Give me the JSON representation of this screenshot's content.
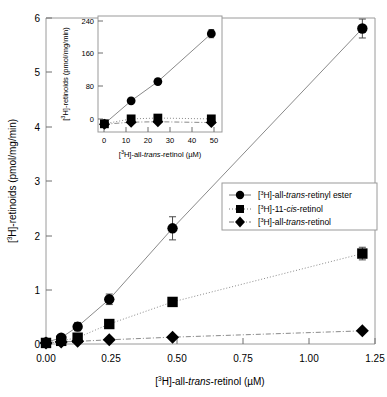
{
  "chart_data": {
    "type": "scatter",
    "title": "",
    "xlabel": "[3H]-all-trans-retinol (µM)",
    "ylabel": "[3H]-retinoids (pmol/mg/min)",
    "xlim": [
      0.0,
      1.3
    ],
    "ylim": [
      0.0,
      6.2
    ],
    "xticks": [
      "0.00",
      "0.25",
      "0.50",
      "0.75",
      "1.00",
      "1.25"
    ],
    "xtick_values": [
      0.0,
      0.25,
      0.5,
      0.75,
      1.0,
      1.25
    ],
    "yticks": [
      "0",
      "1",
      "2",
      "3",
      "4",
      "5",
      "6"
    ],
    "ytick_values": [
      0,
      1,
      2,
      3,
      4,
      5,
      6
    ],
    "grid": false,
    "legend_position": "center-right",
    "series": [
      {
        "name": "[3H]-all-trans-retinyl ester",
        "marker": "circle",
        "line": "solid",
        "x": [
          0.0,
          0.06,
          0.125,
          0.25,
          0.5,
          1.25
        ],
        "values": [
          0.03,
          0.12,
          0.33,
          0.85,
          2.2,
          6.0
        ],
        "errors": [
          0.03,
          0.05,
          0.08,
          0.1,
          0.22,
          0.18
        ]
      },
      {
        "name": "[3H]-11-cis-retinol",
        "marker": "square",
        "line": "dotted",
        "x": [
          0.0,
          0.06,
          0.125,
          0.25,
          0.5,
          1.25
        ],
        "values": [
          0.02,
          0.06,
          0.12,
          0.38,
          0.8,
          1.72
        ],
        "errors": [
          0.02,
          0.03,
          0.04,
          0.05,
          0.06,
          0.12
        ]
      },
      {
        "name": "[3H]-all-trans-retinol",
        "marker": "diamond",
        "line": "dashdot",
        "x": [
          0.0,
          0.06,
          0.125,
          0.25,
          0.5,
          1.25
        ],
        "values": [
          0.02,
          0.04,
          0.05,
          0.08,
          0.13,
          0.25
        ],
        "errors": [
          0.02,
          0.02,
          0.02,
          0.02,
          0.03,
          0.03
        ]
      }
    ]
  },
  "inset_chart_data": {
    "type": "scatter",
    "title": "",
    "xlabel": "[3H]-all-trans-retinol (µM)",
    "ylabel": "[3H]-retinoids (pmol/mg/min)",
    "xlim": [
      -3,
      55
    ],
    "ylim": [
      -18,
      265
    ],
    "xticks": [
      "0",
      "10",
      "20",
      "30",
      "40",
      "50"
    ],
    "xtick_values": [
      0,
      10,
      20,
      30,
      40,
      50
    ],
    "yticks": [
      "0",
      "80",
      "160",
      "240"
    ],
    "ytick_values": [
      0,
      80,
      160,
      240
    ],
    "grid": false,
    "series": [
      {
        "name": "[3H]-all-trans-retinyl ester",
        "marker": "circle",
        "line": "solid",
        "x": [
          0,
          12.5,
          25,
          50
        ],
        "values": [
          2,
          58,
          105,
          222
        ],
        "errors": [
          2,
          5,
          6,
          10
        ]
      },
      {
        "name": "[3H]-11-cis-retinol",
        "marker": "square",
        "line": "dotted",
        "x": [
          0,
          12.5,
          25,
          50
        ],
        "values": [
          2,
          14,
          16,
          14
        ],
        "errors": [
          2,
          4,
          4,
          4
        ]
      },
      {
        "name": "[3H]-all-trans-retinol",
        "marker": "diamond",
        "line": "dashdot",
        "x": [
          0,
          12.5,
          25,
          50
        ],
        "values": [
          1,
          6,
          7,
          5
        ],
        "errors": [
          1,
          3,
          3,
          3
        ]
      }
    ]
  },
  "axis_labels": {
    "x_prefix": "[",
    "x_sup": "3",
    "x_mid": "H]-all-",
    "x_italic": "trans",
    "x_suffix": "-retinol (µM)",
    "y_prefix": "[",
    "y_sup": "3",
    "y_suffix": "H]-retinoids (pmol/mg/min)"
  },
  "legend": {
    "items": [
      {
        "label": "[3H]-all-trans-retinyl ester",
        "pre": "[",
        "sup": "3",
        "mid": "H]-all-",
        "italic": "trans",
        "post": "-retinyl ester",
        "marker": "circle",
        "line": "solid"
      },
      {
        "label": "[3H]-11-cis-retinol",
        "pre": "[",
        "sup": "3",
        "mid": "H]-11-",
        "italic": "cis",
        "post": "-retinol",
        "marker": "square",
        "line": "dotted"
      },
      {
        "label": "[3H]-all-trans-retinol",
        "pre": "[",
        "sup": "3",
        "mid": "H]-all-",
        "italic": "trans",
        "post": "-retinol",
        "marker": "diamond",
        "line": "dashdot"
      }
    ]
  },
  "colors": {
    "marker": "#000000",
    "axis": "#808080",
    "line": "#888888",
    "background": "#ffffff",
    "frame": "#9a9a9a"
  }
}
